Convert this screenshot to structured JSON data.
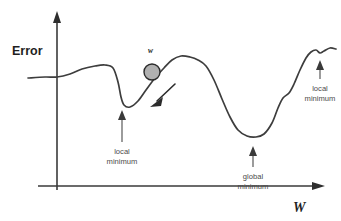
{
  "figure": {
    "background_color": "#ffffff",
    "curve_color": "#3d3d3d",
    "axis_color": "#3a3a3a",
    "ball_fill_color": "#b0b0b0",
    "ball_stroke_color": "#2b2b2b",
    "callout_color": "#4a4a4a"
  },
  "axes": {
    "y_label": "Error",
    "x_label": "W"
  },
  "marker": {
    "label": "w",
    "descent_arrow": "gradient-descent-direction"
  },
  "annotations": [
    {
      "id": "local-minimum-left",
      "line1": "local",
      "line2": "minimum"
    },
    {
      "id": "global-minimum",
      "line1": "global",
      "line2": "minimum"
    },
    {
      "id": "local-minimum-right",
      "line1": "local",
      "line2": "minimum"
    }
  ],
  "chart_data": {
    "type": "line",
    "xlabel": "W",
    "ylabel": "Error",
    "grid": false,
    "legend": null,
    "xlim": [
      0,
      341
    ],
    "ylim": [
      221,
      0
    ],
    "series": [
      {
        "name": "error-surface",
        "description": "Non-convex error curve over weight space with two local minima and one global minimum",
        "points": [
          [
            28,
            78
          ],
          [
            45,
            77
          ],
          [
            57,
            77
          ],
          [
            70,
            74
          ],
          [
            82,
            69
          ],
          [
            95,
            66
          ],
          [
            105,
            65
          ],
          [
            113,
            68
          ],
          [
            118,
            82
          ],
          [
            121,
            97
          ],
          [
            124,
            105
          ],
          [
            130,
            107
          ],
          [
            138,
            101
          ],
          [
            146,
            90
          ],
          [
            155,
            78
          ],
          [
            164,
            68
          ],
          [
            172,
            60
          ],
          [
            181,
            56
          ],
          [
            190,
            57
          ],
          [
            198,
            60
          ],
          [
            206,
            66
          ],
          [
            214,
            80
          ],
          [
            222,
            99
          ],
          [
            230,
            117
          ],
          [
            238,
            130
          ],
          [
            247,
            136
          ],
          [
            256,
            137
          ],
          [
            264,
            134
          ],
          [
            272,
            123
          ],
          [
            278,
            108
          ],
          [
            283,
            98
          ],
          [
            289,
            93
          ],
          [
            294,
            84
          ],
          [
            300,
            70
          ],
          [
            306,
            58
          ],
          [
            311,
            52
          ],
          [
            316,
            50
          ],
          [
            320,
            53
          ],
          [
            324,
            51
          ],
          [
            330,
            48
          ],
          [
            336,
            49
          ]
        ]
      }
    ],
    "features": [
      {
        "name": "local minimum (left)",
        "x": 124,
        "y": 105
      },
      {
        "name": "global minimum",
        "x": 256,
        "y": 137
      },
      {
        "name": "local minimum (right)",
        "x": 320,
        "y": 53
      },
      {
        "name": "current weight marker w",
        "x": 152,
        "y": 72
      }
    ]
  }
}
